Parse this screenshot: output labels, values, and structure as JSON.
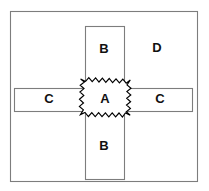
{
  "diagram": {
    "type": "set-region-diagram",
    "canvas": {
      "width": 209,
      "height": 191,
      "background": "#ffffff"
    },
    "colors": {
      "outline": "#7d7d7d",
      "starburst_stroke": "#000000",
      "label_text": "#111111",
      "fill": "#ffffff"
    },
    "regions": [
      {
        "key": "outer",
        "name": "outer-rectangle",
        "label": "D",
        "shape": "rectangle",
        "x": 10,
        "y": 11,
        "width": 188,
        "height": 171
      },
      {
        "key": "vertical",
        "name": "vertical-strip",
        "label": "B",
        "shape": "rectangle",
        "x": 85,
        "y": 26,
        "width": 40,
        "height": 154
      },
      {
        "key": "horizontal",
        "name": "horizontal-strip",
        "label": "C",
        "shape": "rectangle",
        "x": 14,
        "y": 88,
        "width": 179,
        "height": 24
      },
      {
        "key": "intersection",
        "name": "intersection-starburst",
        "label": "A",
        "shape": "starburst",
        "x": 79,
        "y": 79,
        "width": 52,
        "height": 40
      }
    ],
    "labels": [
      {
        "key": "b_top",
        "text": "B",
        "x": 104,
        "y": 50
      },
      {
        "key": "d_right",
        "text": "D",
        "x": 157,
        "y": 49
      },
      {
        "key": "c_left",
        "text": "C",
        "x": 49,
        "y": 100
      },
      {
        "key": "a_center",
        "text": "A",
        "x": 105,
        "y": 100
      },
      {
        "key": "c_right",
        "text": "C",
        "x": 160,
        "y": 100
      },
      {
        "key": "b_bottom",
        "text": "B",
        "x": 104,
        "y": 147
      }
    ]
  }
}
